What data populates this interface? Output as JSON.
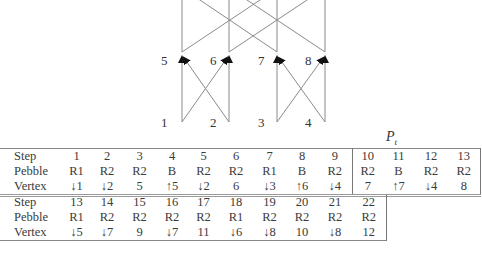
{
  "diagram": {
    "nodes": [
      {
        "id": "1",
        "x": 164,
        "y": 116
      },
      {
        "id": "2",
        "x": 211,
        "y": 116
      },
      {
        "id": "3",
        "x": 259,
        "y": 116
      },
      {
        "id": "4",
        "x": 306,
        "y": 116
      },
      {
        "id": "5",
        "x": 160,
        "y": 55
      },
      {
        "id": "6",
        "x": 210,
        "y": 55
      },
      {
        "id": "7",
        "x": 258,
        "y": 55
      },
      {
        "id": "8",
        "x": 305,
        "y": 55
      }
    ],
    "edge_color": "#888888",
    "arrow_color": "#111111"
  },
  "partition_label": "P",
  "partition_subscript": "t",
  "table1": {
    "headers": [
      "Step",
      "Pebble",
      "Vertex"
    ],
    "steps": [
      "1",
      "2",
      "3",
      "4",
      "5",
      "6",
      "7",
      "8",
      "9",
      "10",
      "11",
      "12",
      "13"
    ],
    "pebbles": [
      "R1",
      "R2",
      "R2",
      "B",
      "R2",
      "R2",
      "R1",
      "B",
      "R2",
      "R2",
      "B",
      "R2",
      "R2"
    ],
    "vertices": [
      "↓1",
      "↓2",
      "5",
      "↑5",
      "↓2",
      "6",
      "↓3",
      "↑6",
      "↓4",
      "7",
      "↑7",
      "↓4",
      "8"
    ]
  },
  "table2": {
    "headers": [
      "Step",
      "Pebble",
      "Vertex"
    ],
    "steps": [
      "13",
      "14",
      "15",
      "16",
      "17",
      "18",
      "19",
      "20",
      "21",
      "22"
    ],
    "pebbles": [
      "R1",
      "R2",
      "R2",
      "R2",
      "R2",
      "R1",
      "R2",
      "R2",
      "R2",
      "R2"
    ],
    "vertices": [
      "↓5",
      "↓7",
      "9",
      "↓7",
      "11",
      "↓6",
      "↓8",
      "10",
      "↓8",
      "12"
    ]
  }
}
